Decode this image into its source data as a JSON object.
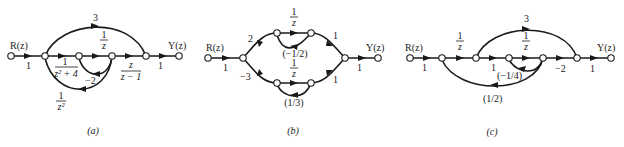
{
  "figure": {
    "diagram_a": {
      "caption": "(a)",
      "input_label": "R(z)",
      "output_label": "Y(z)",
      "gains": {
        "input": "1",
        "feedforward": "3",
        "g1_num": "1",
        "g1_den": "z² + 4",
        "g2_num": "1",
        "g2_den": "z",
        "g3_num": "z",
        "g3_den": "z − 1",
        "inner_feedback": "−2",
        "outer_feedback_num": "1",
        "outer_feedback_den": "z²",
        "output": "1"
      }
    },
    "diagram_b": {
      "caption": "(b)",
      "input_label": "R(z)",
      "output_label": "Y(z)",
      "gains": {
        "input": "1",
        "upper_split": "2",
        "lower_split": "−3",
        "upper_delay_num": "1",
        "upper_delay_den": "z",
        "upper_feedback": "(−1/2)",
        "lower_delay_num": "1",
        "lower_delay_den": "z",
        "lower_feedback": "(1/3)",
        "upper_merge": "1",
        "lower_merge": "1",
        "output": "1"
      }
    },
    "diagram_c": {
      "caption": "(c)",
      "input_label": "R(z)",
      "output_label": "Y(z)",
      "gains": {
        "input": "1",
        "delay1_num": "1",
        "delay1_den": "z",
        "feedforward": "3",
        "unity": "1",
        "delay2_num": "1",
        "delay2_den": "z",
        "inner_feedback": "(−1/4)",
        "gain_neg2": "−2",
        "outer_feedback": "(1/2)",
        "output": "1"
      }
    }
  }
}
